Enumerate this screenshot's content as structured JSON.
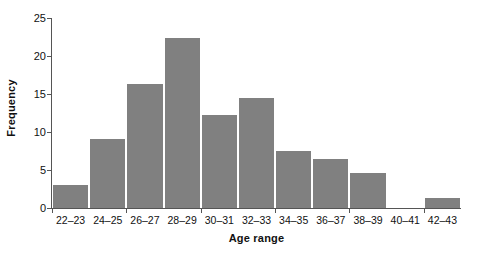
{
  "chart_data": {
    "type": "bar",
    "title": "",
    "xlabel": "Age range",
    "ylabel": "Frequency",
    "categories": [
      "22–23",
      "24–25",
      "26–27",
      "28–29",
      "30–31",
      "32–33",
      "34–35",
      "36–37",
      "38–39",
      "40–41",
      "42–43"
    ],
    "values": [
      3.0,
      9.1,
      16.3,
      22.4,
      12.2,
      14.5,
      7.5,
      6.4,
      4.6,
      0,
      1.3
    ],
    "ylim": [
      0,
      25
    ],
    "yticks": [
      0,
      5,
      10,
      15,
      20,
      25
    ],
    "ytick_labels": [
      "0",
      "5",
      "10",
      "15",
      "20",
      "25"
    ],
    "grid": false,
    "legend": null,
    "bar_color": "#808080",
    "axis_color": "#555555",
    "text_color": "#111111",
    "background": "#ffffff"
  }
}
